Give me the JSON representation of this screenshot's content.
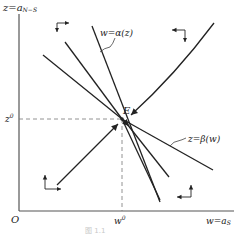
{
  "diagram": {
    "type": "phase-diagram",
    "axes": {
      "y_label": "z=a",
      "y_label_sub": "N−S",
      "x_label": "w=a",
      "x_label_sub": "S",
      "origin": "O"
    },
    "equilibrium": {
      "label": "E",
      "w_label": "w",
      "w_label_sup": "0",
      "z_label": "z",
      "z_label_sup": "0"
    },
    "curves": [
      {
        "id": "alpha",
        "label": "w=α(z)"
      },
      {
        "id": "beta",
        "label": "z=β(w)"
      }
    ],
    "direction_arrows": [
      {
        "region": "top-left",
        "directions": [
          "right",
          "down"
        ]
      },
      {
        "region": "top-right",
        "directions": [
          "left",
          "down"
        ]
      },
      {
        "region": "bottom-left",
        "directions": [
          "right",
          "up"
        ]
      },
      {
        "region": "bottom-right",
        "directions": [
          "left",
          "up"
        ]
      }
    ],
    "caption": "图 1.1"
  }
}
